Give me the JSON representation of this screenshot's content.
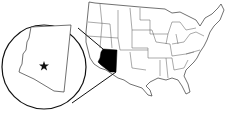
{
  "map": {
    "type": "locator-map",
    "region": "United States",
    "highlighted_state": "Arizona",
    "highlight_color": "#000000",
    "outline_color": "#222222",
    "background_color": "#ffffff",
    "inset": {
      "shape": "circle",
      "content": "Arizona",
      "marker": "star-icon"
    }
  }
}
